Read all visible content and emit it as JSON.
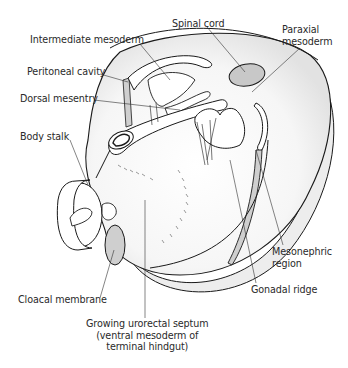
{
  "figure": {
    "colors": {
      "outline": "#1a1a1a",
      "leader_line": "#333333",
      "grey_fill": "#c8c8c8",
      "light_grey_fill": "#e6e6e6",
      "white_fill": "#ffffff",
      "text": "#2a2a2a"
    }
  },
  "labels": {
    "spinal_cord": "Spinal cord",
    "paraxial_mesoderm": "Paraxial\nmesoderm",
    "intermediate_mesoderm": "Intermediate mesoderm",
    "peritoneal_cavity": "Peritoneal cavity",
    "dorsal_mesentry": "Dorsal mesentry",
    "body_stalk": "Body stalk",
    "mesonephric_region": "Mesonephric\nregion",
    "gonadal_ridge": "Gonadal ridge",
    "cloacal_membrane": "Cloacal membrane",
    "growing_urorectal_septum": "Growing urorectal septum\n(ventral mesoderm of\nterminal hindgut)"
  }
}
